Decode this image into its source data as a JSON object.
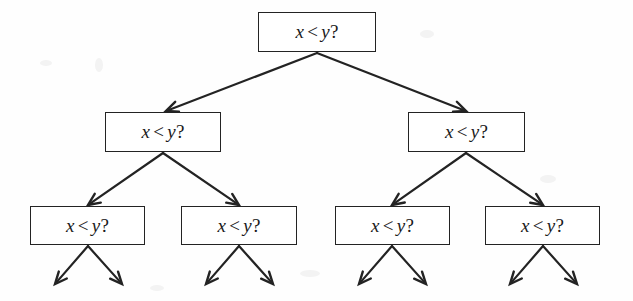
{
  "diagram": {
    "type": "decision-tree",
    "background_color": "#fefefe",
    "stroke_color": "#232323",
    "text_color": "#1a1a1a",
    "levels": 3,
    "node_label_text": "x < y?",
    "label_parts": {
      "left_operand": "x",
      "operator": "<",
      "right_operand": "y",
      "question_mark": "?"
    },
    "nodes": [
      {
        "id": "n0",
        "label": "x < y?",
        "level": 0,
        "x": 258,
        "y": 12,
        "w": 118,
        "h": 40
      },
      {
        "id": "n1",
        "label": "x < y?",
        "level": 1,
        "x": 105,
        "y": 112,
        "w": 116,
        "h": 40
      },
      {
        "id": "n2",
        "label": "x < y?",
        "level": 1,
        "x": 408,
        "y": 112,
        "w": 117,
        "h": 40
      },
      {
        "id": "n3",
        "label": "x < y?",
        "level": 2,
        "x": 30,
        "y": 206,
        "w": 115,
        "h": 39
      },
      {
        "id": "n4",
        "label": "x < y?",
        "level": 2,
        "x": 181,
        "y": 206,
        "w": 116,
        "h": 39
      },
      {
        "id": "n5",
        "label": "x < y?",
        "level": 2,
        "x": 335,
        "y": 206,
        "w": 115,
        "h": 39
      },
      {
        "id": "n6",
        "label": "x < y?",
        "level": 2,
        "x": 485,
        "y": 206,
        "w": 115,
        "h": 39
      }
    ],
    "edges": [
      {
        "from": "n0",
        "to": "n1",
        "x1": 317,
        "y1": 53,
        "x2": 166,
        "y2": 111
      },
      {
        "from": "n0",
        "to": "n2",
        "x1": 317,
        "y1": 53,
        "x2": 466,
        "y2": 111
      },
      {
        "from": "n1",
        "to": "n3",
        "x1": 163,
        "y1": 153,
        "x2": 88,
        "y2": 205
      },
      {
        "from": "n1",
        "to": "n4",
        "x1": 163,
        "y1": 153,
        "x2": 239,
        "y2": 205
      },
      {
        "from": "n2",
        "to": "n5",
        "x1": 466,
        "y1": 153,
        "x2": 392,
        "y2": 205
      },
      {
        "from": "n2",
        "to": "n6",
        "x1": 466,
        "y1": 153,
        "x2": 543,
        "y2": 205
      }
    ],
    "terminal_arrows": [
      {
        "from": "n3",
        "side": "left",
        "x1": 88,
        "y1": 246,
        "x2": 55,
        "y2": 284
      },
      {
        "from": "n3",
        "side": "right",
        "x1": 88,
        "y1": 246,
        "x2": 122,
        "y2": 284
      },
      {
        "from": "n4",
        "side": "left",
        "x1": 239,
        "y1": 246,
        "x2": 206,
        "y2": 284
      },
      {
        "from": "n4",
        "side": "right",
        "x1": 239,
        "y1": 246,
        "x2": 273,
        "y2": 284
      },
      {
        "from": "n5",
        "side": "left",
        "x1": 392,
        "y1": 246,
        "x2": 359,
        "y2": 284
      },
      {
        "from": "n5",
        "side": "right",
        "x1": 392,
        "y1": 246,
        "x2": 426,
        "y2": 284
      },
      {
        "from": "n6",
        "side": "left",
        "x1": 543,
        "y1": 246,
        "x2": 510,
        "y2": 284
      },
      {
        "from": "n6",
        "side": "right",
        "x1": 543,
        "y1": 246,
        "x2": 577,
        "y2": 284
      }
    ]
  }
}
